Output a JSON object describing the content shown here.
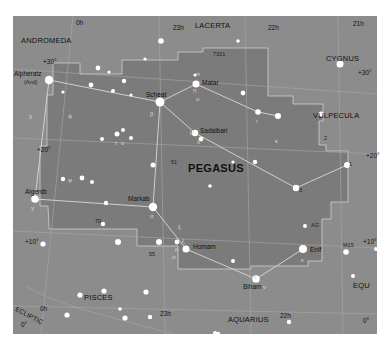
{
  "map": {
    "title": "PEGASUS",
    "background_color": "#8c8c8c",
    "constellation_region_color": "#7e7e7e",
    "line_color": "#c8c8c8",
    "star_color": "#ffffff"
  },
  "constellations": {
    "main": "PEGASUS",
    "neighbors": [
      "ANDROMEDA",
      "LACERTA",
      "CYGNUS",
      "VULPECULA",
      "EQU",
      "AQUARIUS",
      "PISCES"
    ]
  },
  "labels": {
    "andromeda": "ANDROMEDA",
    "lacerta": "LACERTA",
    "cygnus": "CYGNUS",
    "vulpecula": "VULPECULA",
    "equ": "EQU",
    "aquarius": "AQUARIUS",
    "pisces": "PISCES",
    "pegasus": "PEGASUS",
    "ecliptic": "ECLIPTIC"
  },
  "grid": {
    "ra_top": [
      "0h",
      "23h",
      "22h",
      "21h"
    ],
    "ra_bottom": [
      "0h",
      "23h",
      "22h"
    ],
    "dec": [
      "+30°",
      "+20°",
      "+10°",
      "0°"
    ],
    "ra_0h_top": "0h",
    "ra_23h_top": "23h",
    "ra_22h_top": "22h",
    "ra_21h_top": "21h",
    "ra_0h_bottom": "0h",
    "ra_23h_bottom": "23h",
    "ra_22h_bottom": "22h",
    "dec_30_left": "+30°",
    "dec_30_right": "+30°",
    "dec_20_left": "+20°",
    "dec_20_right": "+20°",
    "dec_10_left": "+10°",
    "dec_10_right": "+10°",
    "dec_0_left": "0°",
    "dec_0_right": "0°",
    "ecliptic_0": "0°"
  },
  "stars": {
    "alpheratz": "Alpheratz",
    "alpheratz_alt": "(And)",
    "scheat": "Scheat",
    "matar": "Matar",
    "sadalbari": "Sadalbari",
    "markab": "Markab",
    "algenib": "Algenib",
    "homam": "Homam",
    "enif": "Enif",
    "biham": "Biham"
  },
  "designations": {
    "ngc7331": "7331",
    "m15": "M15",
    "s51": "51",
    "s70": "70",
    "s55": "55",
    "s1": "1",
    "s2": "2",
    "s3": "3",
    "ag": "AG"
  },
  "greek": {
    "alpha": "α",
    "beta": "β",
    "gamma": "γ",
    "epsilon": "ε",
    "eta": "η",
    "theta": "θ",
    "zeta": "ζ",
    "mu": "μ",
    "lambda": "λ",
    "kappa": "κ",
    "iota": "ι",
    "nu": "ν",
    "xi": "ξ",
    "pi": "π",
    "omicron": "ο",
    "psi": "ψ",
    "upsilon": "υ",
    "phi": "φ",
    "chi": "χ",
    "tau": "τ",
    "rho": "ρ",
    "sigma": "σ"
  }
}
